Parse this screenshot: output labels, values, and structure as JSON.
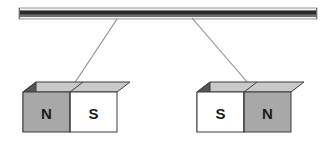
{
  "diagram": {
    "background_color": "#fefefe",
    "support_rod": {
      "name": "horizontal support rod",
      "x1": 19,
      "x2": 317,
      "y_top": 8,
      "y_bottom": 19,
      "highlight_color": "#f2f2f2",
      "core_color": "#2b2b2b",
      "edge_color": "#9a9a9a",
      "shade_color": "#6f6f6f"
    },
    "strings": [
      {
        "name": "left-suspension-string",
        "top_x": 117,
        "top_y": 19,
        "bottom_x": 70,
        "bottom_y": 90,
        "color": "#8a8a8a"
      },
      {
        "name": "right-suspension-string",
        "top_x": 192,
        "top_y": 18,
        "bottom_x": 254,
        "bottom_y": 90,
        "color": "#8a8a8a"
      }
    ],
    "magnets": [
      {
        "name": "left-magnet",
        "front_x": 23,
        "front_y": 92,
        "front_width": 94,
        "front_height": 40,
        "depth_x": 13,
        "depth_y": -10,
        "split_ratio": 0.5,
        "left_pole": "N",
        "right_pole": "S",
        "left_pole_color": "#a8a8a8",
        "right_pole_color": "#ffffff",
        "top_face_color": "#c9c9c9",
        "side_face_color": "#555555",
        "outline_color": "#3d3d3d"
      },
      {
        "name": "right-magnet",
        "front_x": 197,
        "front_y": 92,
        "front_width": 94,
        "front_height": 40,
        "depth_x": 13,
        "depth_y": -10,
        "split_ratio": 0.5,
        "left_pole": "S",
        "right_pole": "N",
        "left_pole_color": "#ffffff",
        "right_pole_color": "#a8a8a8",
        "top_face_color": "#c9c9c9",
        "side_face_color": "#555555",
        "outline_color": "#3d3d3d"
      }
    ]
  }
}
